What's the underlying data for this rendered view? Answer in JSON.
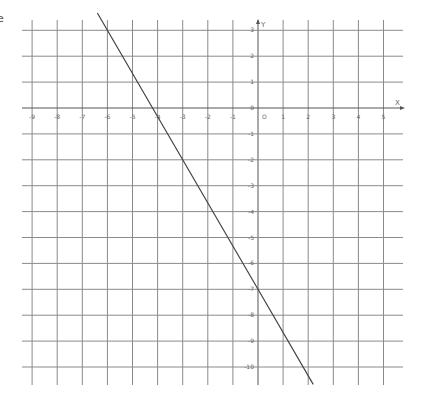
{
  "chart_data": {
    "type": "line",
    "title": "",
    "xlabel": "X",
    "ylabel": "Y",
    "origin_label": "O",
    "xlim": [
      -9.4,
      5.7
    ],
    "ylim": [
      -10.7,
      3.4
    ],
    "grid": true,
    "x_ticks": [
      -9,
      -8,
      -7,
      -6,
      -5,
      -4,
      -3,
      -2,
      -1,
      0,
      1,
      2,
      3,
      4,
      5
    ],
    "y_ticks": [
      3,
      2,
      1,
      0,
      -1,
      -2,
      -3,
      -4,
      -5,
      -6,
      -7,
      -8,
      -9,
      -10
    ],
    "x_tick_labels": [
      "-9",
      "-8",
      "-7",
      "-6",
      "-5",
      "-4",
      "-3",
      "-2",
      "-1",
      "0",
      "1",
      "2",
      "3",
      "4",
      "5"
    ],
    "y_tick_labels": [
      "3",
      "2",
      "1",
      "0",
      "-1",
      "-2",
      "-3",
      "-4",
      "-5",
      "-6",
      "-7",
      "-8",
      "-9",
      "-10"
    ],
    "series": [
      {
        "name": "line",
        "equation": "y = -5/3 x - 7",
        "x": [
          -6.4,
          -6,
          -4.2,
          -3,
          0,
          2.2
        ],
        "y": [
          3.67,
          3,
          0,
          -2,
          -7,
          -10.67
        ],
        "color": "#444444"
      }
    ]
  },
  "layout": {
    "px_origin_x": 258,
    "px_origin_y": 108,
    "px_per_unit_x": 25.1,
    "px_per_unit_y": 25.9,
    "grid_left": 22,
    "grid_right": 403,
    "grid_top": 20,
    "grid_bottom": 385,
    "grid_color": "#8a8a8a",
    "axis_color": "#555555",
    "label_color": "#666666"
  },
  "edge_glyph": "e"
}
